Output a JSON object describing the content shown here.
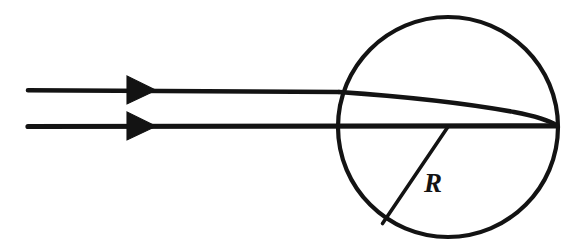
{
  "figure": {
    "background_color": "#ffffff",
    "ink_color": "#131313",
    "labels": {
      "radius": "R"
    },
    "icons": {
      "upper_arrow": "arrowhead-right-icon",
      "lower_arrow": "arrowhead-right-icon"
    },
    "geometry": {
      "canvas": {
        "width": 587,
        "height": 252
      },
      "sphere": {
        "cx": 448,
        "cy": 127,
        "r": 110
      },
      "upper_ray": {
        "start": {
          "x": 28,
          "y": 90
        },
        "entry": {
          "x": 340,
          "y": 92
        },
        "focus": {
          "x": 556,
          "y": 125
        }
      },
      "lower_ray": {
        "start": {
          "x": 28,
          "y": 126
        },
        "focus": {
          "x": 556,
          "y": 126
        }
      },
      "radius_segment": {
        "from": {
          "x": 448,
          "y": 126
        },
        "to": {
          "x": 383,
          "y": 223
        }
      },
      "upper_arrowhead": {
        "x": 127,
        "y": 76,
        "width": 28,
        "height": 28
      },
      "lower_arrowhead": {
        "x": 127,
        "y": 112,
        "width": 28,
        "height": 28
      },
      "radius_label_position": {
        "x": 424,
        "y": 192
      }
    }
  }
}
